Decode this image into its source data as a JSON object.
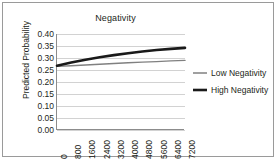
{
  "chart_data": {
    "type": "line",
    "title": "Negativity",
    "xlabel": "",
    "ylabel": "Predicted Probability",
    "ylim": [
      0.0,
      0.4
    ],
    "xlim": [
      0,
      7200
    ],
    "grid": true,
    "legend_position": "right",
    "y_ticks": [
      "0.40",
      "0.35",
      "0.30",
      "0.25",
      "0.20",
      "0.15",
      "0.10",
      "0.05",
      "0.00"
    ],
    "y_tick_values": [
      0.4,
      0.35,
      0.3,
      0.25,
      0.2,
      0.15,
      0.1,
      0.05,
      0.0
    ],
    "categories": [
      "0",
      "800",
      "1600",
      "2400",
      "3200",
      "4000",
      "4800",
      "5600",
      "6400",
      "7200"
    ],
    "x": [
      0,
      800,
      1600,
      2400,
      3200,
      4000,
      4800,
      5600,
      6400,
      7200
    ],
    "series": [
      {
        "name": "Low Negativity",
        "color": "#808080",
        "width": 1.4,
        "values": [
          0.265,
          0.268,
          0.271,
          0.274,
          0.277,
          0.28,
          0.283,
          0.285,
          0.288,
          0.29
        ]
      },
      {
        "name": "High Negativity",
        "color": "#1a1a1a",
        "width": 2.6,
        "values": [
          0.268,
          0.281,
          0.293,
          0.303,
          0.312,
          0.32,
          0.327,
          0.333,
          0.338,
          0.342
        ]
      }
    ]
  },
  "legend": {
    "items": [
      {
        "label": "Low Negativity"
      },
      {
        "label": "High Negativity"
      }
    ]
  },
  "colors": {
    "low_series": "#808080",
    "high_series": "#1a1a1a",
    "gridline": "#d2d2d2",
    "axis": "#8c8c8c",
    "frame": "#9a9a9a",
    "text": "#231f20"
  }
}
